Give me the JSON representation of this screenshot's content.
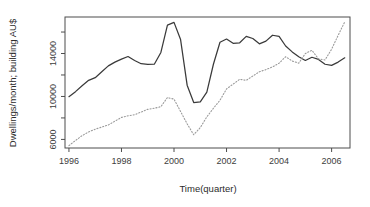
{
  "chart_data": {
    "type": "line",
    "title": "",
    "xlabel": "Time(quarter)",
    "ylabel": "Dwellings/month; building AU$",
    "xlim": [
      1995.85,
      2006.7
    ],
    "ylim": [
      5200,
      17400
    ],
    "grid": false,
    "legend": "none",
    "x_ticks": [
      1996,
      1998,
      2000,
      2002,
      2004,
      2006
    ],
    "x_tick_labels": [
      "1996",
      "1998",
      "2000",
      "2002",
      "2004",
      "2006"
    ],
    "x_minor_ticks": [
      1997,
      1999,
      2001,
      2003,
      2005
    ],
    "y_ticks": [
      6000,
      10000,
      14000
    ],
    "y_tick_labels": [
      "6000",
      "10000",
      "14000"
    ],
    "y_minor_ticks": [
      8000,
      12000,
      16000
    ],
    "series": [
      {
        "name": "Dwellings/month",
        "style": "solid",
        "color": "#3a3a3a",
        "x": [
          1996.0,
          1996.25,
          1996.5,
          1996.75,
          1997.0,
          1997.25,
          1997.5,
          1997.75,
          1998.0,
          1998.25,
          1998.5,
          1998.75,
          1999.0,
          1999.25,
          1999.5,
          1999.75,
          2000.0,
          2000.25,
          2000.5,
          2000.75,
          2001.0,
          2001.25,
          2001.5,
          2001.75,
          2002.0,
          2002.25,
          2002.5,
          2002.75,
          2003.0,
          2003.25,
          2003.5,
          2003.75,
          2004.0,
          2004.25,
          2004.5,
          2004.75,
          2005.0,
          2005.25,
          2005.5,
          2005.75,
          2006.0,
          2006.25,
          2006.5
        ],
        "values": [
          9980,
          10450,
          11000,
          11500,
          11750,
          12300,
          12850,
          13200,
          13480,
          13720,
          13350,
          13050,
          12980,
          13000,
          14100,
          16650,
          16900,
          15300,
          11050,
          9430,
          9500,
          10400,
          13000,
          15050,
          15350,
          14950,
          15000,
          15600,
          15400,
          14900,
          15150,
          15700,
          15600,
          14700,
          14150,
          13700,
          13350,
          13650,
          13450,
          13000,
          12900,
          13200,
          13600
        ]
      },
      {
        "name": "Building AU$",
        "style": "dotted",
        "color": "#9a9a9a",
        "x": [
          1996.0,
          1996.25,
          1996.5,
          1996.75,
          1997.0,
          1997.25,
          1997.5,
          1997.75,
          1998.0,
          1998.25,
          1998.5,
          1998.75,
          1999.0,
          1999.25,
          1999.5,
          1999.75,
          2000.0,
          2000.25,
          2000.5,
          2000.75,
          2001.0,
          2001.25,
          2001.5,
          2001.75,
          2002.0,
          2002.25,
          2002.5,
          2002.75,
          2003.0,
          2003.25,
          2003.5,
          2003.75,
          2004.0,
          2004.25,
          2004.5,
          2004.75,
          2005.0,
          2005.25,
          2005.5,
          2005.75,
          2006.0,
          2006.25,
          2006.5
        ],
        "values": [
          5420,
          5900,
          6350,
          6700,
          6950,
          7150,
          7350,
          7700,
          8050,
          8200,
          8300,
          8550,
          8800,
          8900,
          9050,
          9900,
          9750,
          8600,
          7450,
          6430,
          7100,
          8100,
          8900,
          9650,
          10700,
          11150,
          11600,
          11500,
          11900,
          12300,
          12500,
          12750,
          13100,
          13700,
          13300,
          13100,
          14000,
          14300,
          13500,
          13400,
          14400,
          15700,
          16950
        ]
      }
    ]
  },
  "plot": {
    "box": {
      "left": 65,
      "top": 17,
      "right": 350,
      "bottom": 148
    }
  }
}
